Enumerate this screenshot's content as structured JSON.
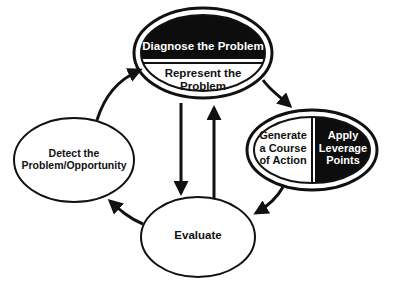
{
  "diagram": {
    "type": "cycle",
    "nodes": {
      "top": {
        "upper_label": "Diagnose the Problem",
        "lower_label": "Represent the Problem"
      },
      "right": {
        "left_label": "Generate a Course of Action",
        "left_lines": [
          "Generate",
          "a Course",
          "of Action"
        ],
        "right_label": "Apply Leverage Points",
        "right_lines": [
          "Apply",
          "Leverage",
          "Points"
        ]
      },
      "bottom": {
        "label": "Evaluate"
      },
      "left": {
        "label": "Detect the Problem/Opportunity",
        "lines": [
          "Detect the",
          "Problem/Opportunity"
        ]
      }
    },
    "edges": [
      {
        "from": "left",
        "to": "top"
      },
      {
        "from": "top",
        "to": "right"
      },
      {
        "from": "right",
        "to": "bottom"
      },
      {
        "from": "bottom",
        "to": "left"
      },
      {
        "from": "top",
        "to": "bottom"
      },
      {
        "from": "bottom",
        "to": "top"
      }
    ],
    "colors": {
      "fill_dark": "#0d0d0d",
      "fill_light": "#ffffff",
      "stroke": "#111111"
    }
  }
}
